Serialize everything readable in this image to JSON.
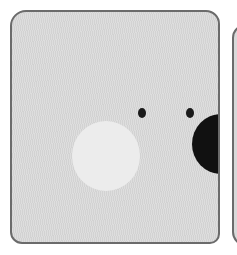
{
  "illustration": {
    "description": "Cartoon panel: light gray square with rounded corners showing part of a face — two small black eyes, a large black nose cut off at the right edge, and a pale cheek circle",
    "colors": {
      "panel_fill": "#d9d9d9",
      "outline": "#6b6b6b",
      "cheek": "#ececec",
      "eyes": "#1a1a1a",
      "nose": "#111111"
    },
    "elements": [
      "panel",
      "cheek",
      "left-eye",
      "right-eye",
      "nose",
      "adjacent-panel-edge"
    ]
  }
}
